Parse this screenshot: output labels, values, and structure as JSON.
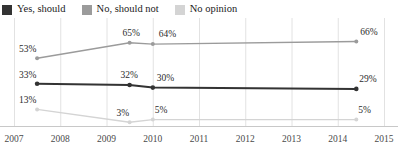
{
  "legend": {
    "position": "top-left",
    "items": [
      {
        "label": "Yes, should",
        "color": "#333333",
        "swatch": "legend-swatch-yes"
      },
      {
        "label": "No, should not",
        "color": "#9b9b9b",
        "swatch": "legend-swatch-no"
      },
      {
        "label": "No opinion",
        "color": "#d4d4d4",
        "swatch": "legend-swatch-noopinion"
      }
    ]
  },
  "chart_data": {
    "type": "line",
    "title": "",
    "xlabel": "",
    "ylabel": "",
    "xlim": [
      2007,
      2015
    ],
    "ylim": [
      0,
      75
    ],
    "grid": true,
    "x": [
      2007.5,
      2009.5,
      2010.0,
      2014.4
    ],
    "xtick_labels": [
      "2007",
      "2008",
      "2009",
      "2010",
      "2011",
      "2012",
      "2013",
      "2014",
      "2015"
    ],
    "xtick_values": [
      2007,
      2008,
      2009,
      2010,
      2011,
      2012,
      2013,
      2014,
      2015
    ],
    "series": [
      {
        "name": "No, should not",
        "color": "#9b9b9b",
        "values": [
          53,
          65,
          64,
          66
        ],
        "labels": [
          "53%",
          "65%",
          "64%",
          "66%"
        ]
      },
      {
        "name": "Yes, should",
        "color": "#333333",
        "values": [
          33,
          32,
          30,
          29
        ],
        "labels": [
          "33%",
          "32%",
          "30%",
          "29%"
        ]
      },
      {
        "name": "No opinion",
        "color": "#d4d4d4",
        "values": [
          13,
          3,
          5,
          5
        ],
        "labels": [
          "13%",
          "3%",
          "5%",
          "5%"
        ]
      }
    ]
  },
  "axis": {
    "baseline_color": "#c8c8c8",
    "gridline_color": "#e2e2e2"
  }
}
